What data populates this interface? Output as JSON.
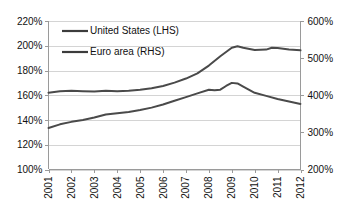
{
  "chart_data": {
    "type": "line",
    "title": "",
    "subtitle": "",
    "xlabel": "",
    "ylabel": "",
    "y2label": "",
    "grid": true,
    "legend_position": "top-left",
    "x": [
      2001,
      2002,
      2003,
      2004,
      2005,
      2006,
      2007,
      2008,
      2009,
      2010,
      2011,
      2012
    ],
    "xtick_labels": [
      "2001",
      "2002",
      "2003",
      "2004",
      "2005",
      "2006",
      "2007",
      "2008",
      "2009",
      "2010",
      "2011",
      "2012"
    ],
    "ylim": [
      100,
      220
    ],
    "ytick_labels": [
      "100%",
      "120%",
      "140%",
      "160%",
      "180%",
      "200%",
      "220%"
    ],
    "ytick_values": [
      100,
      120,
      140,
      160,
      180,
      200,
      220
    ],
    "y2lim": [
      200,
      600
    ],
    "y2tick_labels": [
      "200%",
      "300%",
      "400%",
      "500%",
      "600%"
    ],
    "y2tick_values": [
      200,
      300,
      400,
      500,
      600
    ],
    "series": [
      {
        "name": "United States (LHS)",
        "axis": "left",
        "color": "#4a4a4a",
        "values": [
          133.5,
          138.5,
          142.0,
          145.5,
          148.0,
          152.5,
          158.5,
          164.5,
          170.0,
          162.0,
          157.0,
          153.0
        ],
        "points": [
          {
            "x": 2001.0,
            "y": 133.5
          },
          {
            "x": 2001.5,
            "y": 136.5
          },
          {
            "x": 2002.0,
            "y": 138.5
          },
          {
            "x": 2002.5,
            "y": 140.0
          },
          {
            "x": 2003.0,
            "y": 142.0
          },
          {
            "x": 2003.5,
            "y": 144.5
          },
          {
            "x": 2004.0,
            "y": 145.5
          },
          {
            "x": 2004.5,
            "y": 146.5
          },
          {
            "x": 2005.0,
            "y": 148.0
          },
          {
            "x": 2005.5,
            "y": 150.0
          },
          {
            "x": 2006.0,
            "y": 152.5
          },
          {
            "x": 2006.5,
            "y": 155.5
          },
          {
            "x": 2007.0,
            "y": 158.5
          },
          {
            "x": 2007.5,
            "y": 161.5
          },
          {
            "x": 2008.0,
            "y": 164.5
          },
          {
            "x": 2008.25,
            "y": 164.0
          },
          {
            "x": 2008.5,
            "y": 164.5
          },
          {
            "x": 2008.75,
            "y": 167.5
          },
          {
            "x": 2009.0,
            "y": 170.0
          },
          {
            "x": 2009.25,
            "y": 169.5
          },
          {
            "x": 2009.5,
            "y": 167.0
          },
          {
            "x": 2010.0,
            "y": 162.0
          },
          {
            "x": 2010.5,
            "y": 159.5
          },
          {
            "x": 2011.0,
            "y": 157.0
          },
          {
            "x": 2011.5,
            "y": 155.0
          },
          {
            "x": 2012.0,
            "y": 153.0
          }
        ]
      },
      {
        "name": "Euro area (RHS)",
        "axis": "right",
        "color": "#4a4a4a",
        "values": [
          407,
          412,
          410,
          412,
          415,
          425,
          445,
          480,
          530,
          522,
          527,
          521
        ],
        "points": [
          {
            "x": 2001.0,
            "y": 407
          },
          {
            "x": 2001.5,
            "y": 411
          },
          {
            "x": 2002.0,
            "y": 412
          },
          {
            "x": 2002.5,
            "y": 411
          },
          {
            "x": 2003.0,
            "y": 410
          },
          {
            "x": 2003.5,
            "y": 412
          },
          {
            "x": 2004.0,
            "y": 411
          },
          {
            "x": 2004.5,
            "y": 412
          },
          {
            "x": 2005.0,
            "y": 415
          },
          {
            "x": 2005.5,
            "y": 419
          },
          {
            "x": 2006.0,
            "y": 425
          },
          {
            "x": 2006.5,
            "y": 434
          },
          {
            "x": 2007.0,
            "y": 445
          },
          {
            "x": 2007.5,
            "y": 459
          },
          {
            "x": 2008.0,
            "y": 480
          },
          {
            "x": 2008.5,
            "y": 505
          },
          {
            "x": 2009.0,
            "y": 528
          },
          {
            "x": 2009.25,
            "y": 532
          },
          {
            "x": 2009.5,
            "y": 528
          },
          {
            "x": 2010.0,
            "y": 522
          },
          {
            "x": 2010.5,
            "y": 523
          },
          {
            "x": 2010.75,
            "y": 528
          },
          {
            "x": 2011.0,
            "y": 527
          },
          {
            "x": 2011.5,
            "y": 523
          },
          {
            "x": 2012.0,
            "y": 521
          }
        ]
      }
    ],
    "legend": [
      {
        "label": "United States (LHS)",
        "color": "#4a4a4a"
      },
      {
        "label": "Euro area (RHS)",
        "color": "#4a4a4a"
      }
    ]
  },
  "colors": {
    "background": "#ffffff",
    "grid": "#d4d4d4",
    "axis": "#9a9a9a",
    "line": "#4a4a4a",
    "text": "#111111"
  }
}
